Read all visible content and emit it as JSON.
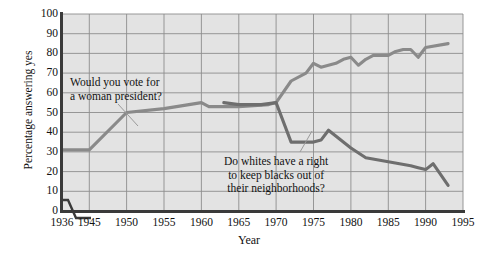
{
  "chart_data": {
    "type": "line",
    "title": "",
    "xlabel": "Year",
    "ylabel": "Percentage answering yes",
    "xlim": [
      1936,
      1995
    ],
    "ylim": [
      0,
      100
    ],
    "grid": true,
    "legend_position": "none",
    "x_ticks": [
      1936,
      1945,
      1950,
      1955,
      1960,
      1965,
      1970,
      1975,
      1980,
      1985,
      1990,
      1995
    ],
    "y_ticks": [
      0,
      10,
      20,
      30,
      40,
      50,
      60,
      70,
      80,
      90,
      100
    ],
    "axis_break": "x-axis break between 1936 and 1945",
    "series": [
      {
        "name": "Would you vote for a woman president?",
        "color": "#8a8a8a",
        "points": [
          [
            1936,
            31
          ],
          [
            1945,
            31
          ],
          [
            1950,
            50
          ],
          [
            1955,
            52
          ],
          [
            1960,
            55
          ],
          [
            1961,
            53
          ],
          [
            1965,
            53
          ],
          [
            1969,
            54
          ],
          [
            1970,
            55
          ],
          [
            1972,
            66
          ],
          [
            1974,
            70
          ],
          [
            1975,
            75
          ],
          [
            1976,
            73
          ],
          [
            1978,
            75
          ],
          [
            1979,
            77
          ],
          [
            1980,
            78
          ],
          [
            1981,
            74
          ],
          [
            1982,
            77
          ],
          [
            1983,
            79
          ],
          [
            1985,
            79
          ],
          [
            1986,
            81
          ],
          [
            1987,
            82
          ],
          [
            1988,
            82
          ],
          [
            1989,
            78
          ],
          [
            1990,
            83
          ],
          [
            1993,
            85
          ]
        ]
      },
      {
        "name": "Do whites have a right to keep blacks out of their neighborhoods?",
        "color": "#6e6e6e",
        "points": [
          [
            1963,
            55
          ],
          [
            1965,
            54
          ],
          [
            1968,
            54
          ],
          [
            1970,
            55
          ],
          [
            1972,
            35
          ],
          [
            1975,
            35
          ],
          [
            1976,
            36
          ],
          [
            1977,
            41
          ],
          [
            1980,
            32
          ],
          [
            1982,
            27
          ],
          [
            1985,
            25
          ],
          [
            1988,
            23
          ],
          [
            1989,
            22
          ],
          [
            1990,
            21
          ],
          [
            1991,
            24
          ],
          [
            1993,
            13
          ]
        ]
      }
    ],
    "annotations": [
      {
        "id": "woman-president",
        "lines": [
          "Would you vote for",
          "a woman president?"
        ],
        "leader_from": [
          118,
          104
        ],
        "leader_to": [
          138,
          126
        ]
      },
      {
        "id": "blacks-neighborhoods",
        "lines": [
          "Do whites have a right",
          "to keep blacks out of",
          "their neighborhoods?"
        ],
        "leader_from": [
          300,
          152
        ],
        "leader_to": [
          312,
          131
        ]
      }
    ]
  },
  "axis_labels": {
    "y_title": "Percentage answering yes",
    "x_title": "Year"
  }
}
